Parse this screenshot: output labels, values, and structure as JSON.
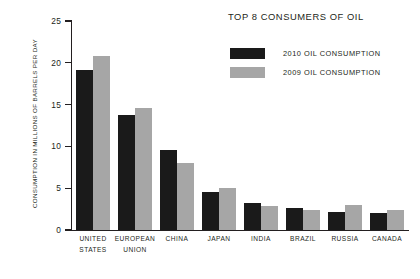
{
  "chart_data": {
    "type": "bar",
    "title": "TOP 8 CONSUMERS OF OIL",
    "xlabel": "",
    "ylabel": "CONSUMPTION IN MILLIONS OF BARRELS PER DAY",
    "ylim": [
      0,
      25
    ],
    "yticks": [
      0,
      5,
      10,
      15,
      20,
      25
    ],
    "ytick_labels": [
      "0",
      "5",
      "10",
      "15",
      "20",
      "25"
    ],
    "grid": false,
    "legend_position": "top-right",
    "categories": [
      "UNITED\nSTATES",
      "EUROPEAN\nUNION",
      "CHINA",
      "JAPAN",
      "INDIA",
      "BRAZIL",
      "RUSSIA",
      "CANADA"
    ],
    "series": [
      {
        "name": "2010 OIL CONSUMPTION",
        "color": "#1a1a1a",
        "values": [
          19.1,
          13.7,
          9.6,
          4.5,
          3.2,
          2.6,
          2.2,
          2.0
        ]
      },
      {
        "name": "2009 OIL CONSUMPTION",
        "color": "#a6a6a6",
        "values": [
          20.8,
          14.6,
          8.0,
          5.0,
          2.9,
          2.4,
          3.0,
          2.4
        ]
      }
    ]
  },
  "legend": {
    "items": [
      {
        "label": "2010 OIL CONSUMPTION",
        "color": "#1a1a1a"
      },
      {
        "label": "2009 OIL CONSUMPTION",
        "color": "#a6a6a6"
      }
    ]
  },
  "colors": {
    "axis": "#231f20",
    "text": "#231f20",
    "background": "#ffffff",
    "series_2010": "#1a1a1a",
    "series_2009": "#a6a6a6"
  }
}
